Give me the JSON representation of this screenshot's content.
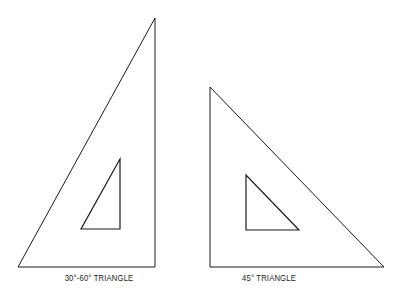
{
  "diagram": {
    "stroke_color": "#1a1a1a",
    "background": "#ffffff",
    "triangles": [
      {
        "name": "30-60-triangle",
        "label": "30°-60° TRIANGLE",
        "outer": "155,18 18,267 155,267",
        "inner": "120,159 81,229 120,229",
        "label_x": 99,
        "label_y": 273
      },
      {
        "name": "45-triangle",
        "label": "45° TRIANGLE",
        "outer": "210,87 210,267 384,267",
        "inner": "246,175 246,230 299,230",
        "label_x": 269,
        "label_y": 273
      }
    ]
  }
}
